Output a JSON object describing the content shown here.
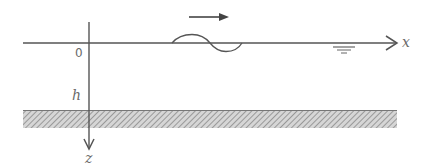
{
  "diagram": {
    "type": "shallow-water wave coordinate sketch",
    "labels": {
      "x_axis": "x",
      "z_axis": "z",
      "origin": "0",
      "depth": "h"
    },
    "elements": [
      "horizontal x-axis (still water surface) with arrow",
      "vertical z-axis pointing downward with arrow",
      "single-period wave profile on the surface",
      "arrow indicating wave propagation direction (rightward)",
      "still-water-level symbol",
      "hatched seabed band at depth h"
    ],
    "colors": {
      "line": "#555555",
      "label": "#6a6a6a",
      "hatch": "#8a8a8a",
      "background": "#ffffff"
    }
  }
}
